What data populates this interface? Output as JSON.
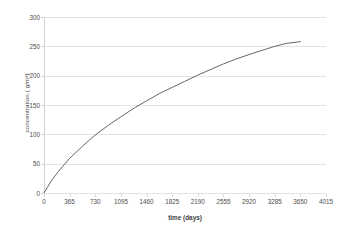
{
  "chart_data": {
    "type": "line",
    "title": "",
    "xlabel": "time (days)",
    "ylabel": "concentration ( g/m³)",
    "xlim": [
      0,
      4015
    ],
    "ylim": [
      0,
      300
    ],
    "grid": true,
    "legend": false,
    "legend_position": "none",
    "x_ticks": [
      0,
      365,
      730,
      1095,
      1460,
      1825,
      2190,
      2555,
      2920,
      3285,
      3650,
      4015
    ],
    "x_tick_labels": [
      "0",
      "365",
      "730",
      "1095",
      "1460",
      "1825",
      "2190",
      "2555",
      "2920",
      "3285",
      "3650",
      "4015"
    ],
    "y_ticks": [
      0,
      50,
      100,
      150,
      200,
      250,
      300
    ],
    "y_tick_labels": [
      "0",
      "50",
      "100",
      "150",
      "200",
      "250",
      "300"
    ],
    "series": [
      {
        "name": "concentration",
        "color": "#555555",
        "x": [
          0,
          100,
          200,
          365,
          550,
          730,
          900,
          1095,
          1300,
          1460,
          1650,
          1825,
          2000,
          2190,
          2400,
          2555,
          2750,
          2920,
          3100,
          3285,
          3450,
          3650
        ],
        "values": [
          0,
          20,
          36,
          59,
          80,
          99,
          114,
          130,
          146,
          157,
          170,
          180,
          190,
          201,
          212,
          220,
          229,
          236,
          243,
          250,
          255,
          258
        ]
      }
    ]
  }
}
